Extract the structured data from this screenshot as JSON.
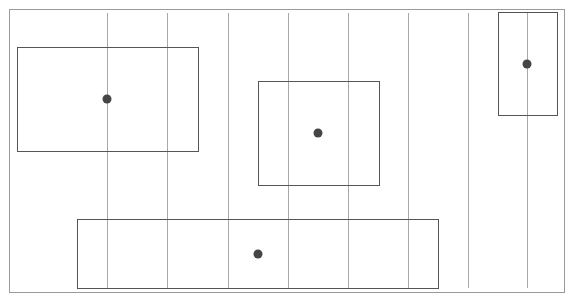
{
  "diagram": {
    "width": 569,
    "height": 297,
    "background": "#ffffff",
    "frame": {
      "x": 9,
      "y": 9,
      "w": 555,
      "h": 283,
      "stroke": "#9a9a9a"
    },
    "grid_lines": {
      "stroke": "#a8a8a8",
      "y1": 13,
      "y2": 288,
      "x": [
        107,
        167,
        228,
        288,
        348,
        408,
        468,
        527
      ]
    },
    "rectangles": [
      {
        "id": "rect-top-left",
        "x": 17,
        "y": 47,
        "w": 181,
        "h": 104,
        "stroke": "#555555"
      },
      {
        "id": "rect-center",
        "x": 258,
        "y": 81,
        "w": 121,
        "h": 104,
        "stroke": "#555555"
      },
      {
        "id": "rect-top-right",
        "x": 498,
        "y": 12,
        "w": 59,
        "h": 103,
        "stroke": "#555555"
      },
      {
        "id": "rect-bottom",
        "x": 77,
        "y": 219,
        "w": 361,
        "h": 69,
        "stroke": "#555555"
      }
    ],
    "points": [
      {
        "id": "dot-top-left",
        "cx": 107,
        "cy": 99,
        "r": 4.5,
        "fill": "#454545"
      },
      {
        "id": "dot-center",
        "cx": 318,
        "cy": 133,
        "r": 4.5,
        "fill": "#454545"
      },
      {
        "id": "dot-top-right",
        "cx": 527,
        "cy": 64,
        "r": 4.5,
        "fill": "#454545"
      },
      {
        "id": "dot-bottom",
        "cx": 258,
        "cy": 254,
        "r": 4.5,
        "fill": "#454545"
      }
    ]
  }
}
